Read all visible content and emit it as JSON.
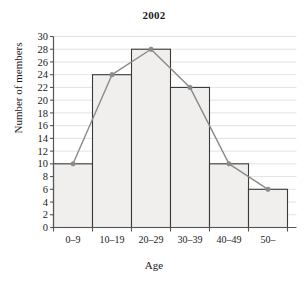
{
  "chart_data": {
    "type": "bar",
    "title": "2002",
    "xlabel": "Age",
    "ylabel": "Number of members",
    "categories": [
      "0–9",
      "10–19",
      "20–29",
      "30–39",
      "40–49",
      "50–"
    ],
    "values": [
      10,
      24,
      28,
      22,
      10,
      6
    ],
    "series": [
      {
        "name": "histogram",
        "values": [
          10,
          24,
          28,
          22,
          10,
          6
        ]
      },
      {
        "name": "frequency-polygon",
        "values": [
          10,
          24,
          28,
          22,
          10,
          6
        ]
      }
    ],
    "ylim": [
      0,
      30
    ],
    "ytick_step": 2,
    "yticks": [
      0,
      2,
      4,
      6,
      8,
      10,
      12,
      14,
      16,
      18,
      20,
      22,
      24,
      26,
      28,
      30
    ],
    "ytick_labels": [
      "0",
      "2",
      "4",
      "6",
      "8",
      "10",
      "12",
      "14",
      "16",
      "18",
      "20",
      "22",
      "24",
      "26",
      "28",
      "30"
    ],
    "grid": true,
    "grid_axis": "y",
    "legend": false,
    "legend_position": "none",
    "bar_fill": "#f0efee",
    "bar_stroke": "#3a3a3a",
    "line_color": "#8a8a8a",
    "marker_color": "#8a8a8a",
    "grid_color": "#dcdcdc",
    "axis_color": "#555555",
    "text_color": "#1a1a1a",
    "background": "#ffffff"
  }
}
